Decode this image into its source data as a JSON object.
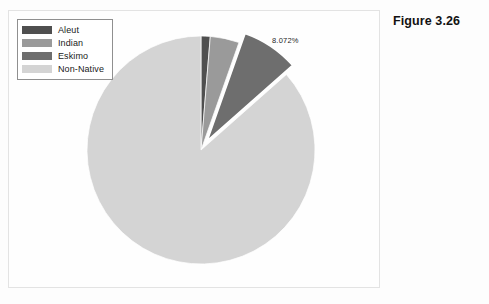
{
  "caption": "Figure 3.26",
  "legend": {
    "items": [
      {
        "label": "Aleut",
        "color": "#4f4f4f"
      },
      {
        "label": "Indian",
        "color": "#9a9a9a"
      },
      {
        "label": "Eskimo",
        "color": "#6e6e6e"
      },
      {
        "label": "Non-Native",
        "color": "#d4d4d4"
      }
    ]
  },
  "callout": {
    "text": "8.072%"
  },
  "chart_data": {
    "type": "pie",
    "title": "",
    "labels": [
      "Aleut",
      "Indian",
      "Eskimo",
      "Non-Native"
    ],
    "values": [
      1.3,
      4.1,
      8.072,
      86.528
    ],
    "unit": "%",
    "colors": [
      "#4f4f4f",
      "#9a9a9a",
      "#6e6e6e",
      "#d4d4d4"
    ],
    "annotations": [
      {
        "label": "Eskimo",
        "text": "8.072%",
        "value": 8.072
      }
    ],
    "exploded": [
      "Eskimo"
    ],
    "start_angle_deg": -90,
    "direction": "clockwise",
    "legend_position": "top-left",
    "grid": false
  }
}
